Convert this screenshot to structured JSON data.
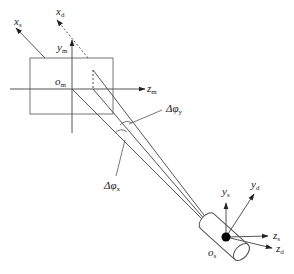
{
  "diagram": {
    "type": "coordinate-frame diagram",
    "colors": {
      "line": "#555555",
      "rect": "#777777",
      "dot": "#000000",
      "text": "#222222"
    },
    "monitor_frame": {
      "origin": {
        "base": "o",
        "sub": "m"
      },
      "axes": [
        {
          "id": "z_m",
          "base": "z",
          "sub": "m"
        },
        {
          "id": "y_m",
          "base": "y",
          "sub": "m"
        },
        {
          "id": "x_s",
          "base": "x",
          "sub": "s"
        },
        {
          "id": "x_d",
          "base": "x",
          "sub": "d"
        }
      ]
    },
    "angles": [
      {
        "id": "dphi_y",
        "base": "Δφ",
        "sub": "y"
      },
      {
        "id": "dphi_x",
        "base": "Δφ",
        "sub": "x"
      }
    ],
    "sensor_frame": {
      "origin": {
        "base": "o",
        "sub": "s"
      },
      "axes": [
        {
          "id": "y_s",
          "base": "y",
          "sub": "s"
        },
        {
          "id": "y_d",
          "base": "y",
          "sub": "d"
        },
        {
          "id": "z_s",
          "base": "z",
          "sub": "s"
        },
        {
          "id": "z_d",
          "base": "z",
          "sub": "d"
        }
      ]
    }
  }
}
